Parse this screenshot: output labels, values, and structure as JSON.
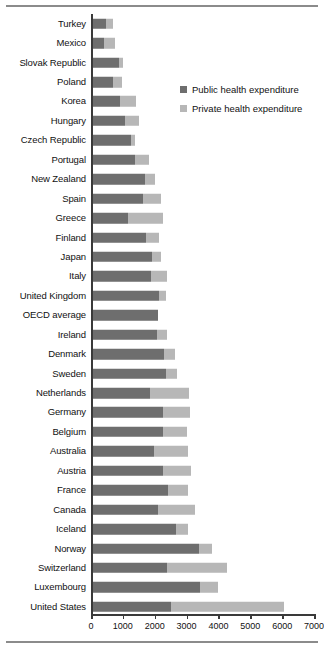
{
  "chart_data": {
    "type": "bar",
    "orientation": "horizontal",
    "stacked": true,
    "title": "",
    "xlabel": "",
    "ylabel": "",
    "xlim": [
      0,
      7000
    ],
    "xticks": [
      0,
      1000,
      2000,
      3000,
      4000,
      5000,
      6000,
      7000
    ],
    "xtick_labels": [
      "0",
      "1000",
      "2000",
      "3000",
      "4000",
      "5000",
      "6000",
      "7000"
    ],
    "grid": false,
    "legend_position": "upper-right-inside",
    "legend": [
      "Public health expenditure",
      "Private health expenditure"
    ],
    "colors": {
      "public": "#6e6e6e",
      "private": "#b7b7b7",
      "axis": "#3a3a3a",
      "rule": "#8b8b8b",
      "text": "#111111"
    },
    "categories": [
      "Turkey",
      "Mexico",
      "Slovak Republic",
      "Poland",
      "Korea",
      "Hungary",
      "Czech Republic",
      "Portugal",
      "New Zealand",
      "Spain",
      "Greece",
      "Finland",
      "Japan",
      "Italy",
      "United Kingdom",
      "OECD average",
      "Ireland",
      "Denmark",
      "Sweden",
      "Netherlands",
      "Germany",
      "Belgium",
      "Australia",
      "Austria",
      "France",
      "Canada",
      "Iceland",
      "Norway",
      "Switzerland",
      "Luxembourg",
      "United States"
    ],
    "series": [
      {
        "name": "Public health expenditure",
        "values": [
          480,
          420,
          890,
          680,
          900,
          1080,
          1250,
          1370,
          1700,
          1620,
          1150,
          1740,
          1920,
          1870,
          2150,
          2090,
          2080,
          2280,
          2350,
          1840,
          2250,
          2250,
          1980,
          2270,
          2420,
          2100,
          2680,
          3400,
          2400,
          3410,
          2520
        ]
      },
      {
        "name": "Private health expenditure",
        "values": [
          220,
          320,
          130,
          300,
          520,
          430,
          140,
          440,
          310,
          580,
          1120,
          380,
          290,
          520,
          210,
          0,
          320,
          370,
          340,
          1240,
          860,
          750,
          1080,
          860,
          640,
          1180,
          380,
          400,
          1870,
          570,
          3530
        ]
      }
    ],
    "totals": [
      700,
      740,
      1020,
      980,
      1420,
      1510,
      1390,
      1810,
      2010,
      2200,
      2270,
      2120,
      2210,
      2390,
      2360,
      2090,
      2400,
      2650,
      2690,
      3080,
      3110,
      3000,
      3060,
      3130,
      3060,
      3280,
      3060,
      3800,
      4270,
      3980,
      6050
    ]
  }
}
